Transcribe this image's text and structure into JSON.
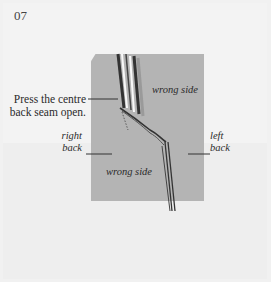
{
  "step": {
    "number": "07"
  },
  "instruction": {
    "line1": "Press the centre",
    "line2": "back seam open."
  },
  "labels": {
    "wrong_side_top": "wrong side",
    "wrong_side_bottom": "wrong side",
    "right_back_1": "right",
    "right_back_2": "back",
    "left_back_1": "left",
    "left_back_2": "back"
  },
  "colors": {
    "page_background": "#f1f1f1",
    "fabric_panel": "#b4b4b4",
    "seam_lines": "#2a2a2a"
  }
}
